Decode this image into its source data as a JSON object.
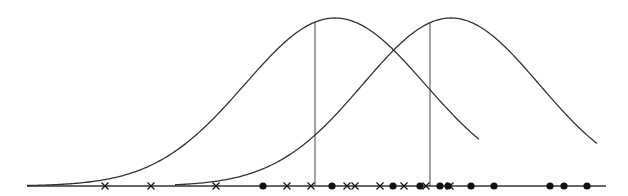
{
  "diagram": {
    "title": "",
    "type": "gaussian-mixture-1d",
    "axis": {
      "x_start": 27,
      "x_end": 606,
      "y": 186,
      "color": "#333333"
    },
    "curves": [
      {
        "name": "gaussian-2",
        "mean_px": 335,
        "sigma_px": 90,
        "peak_y": 18,
        "x_start": 27,
        "x_end": 480
      },
      {
        "name": "gaussian-1",
        "mean_px": 451,
        "sigma_px": 88,
        "peak_y": 18,
        "x_start": 175,
        "x_end": 597
      }
    ],
    "mean_lines": [
      {
        "name": "mu2-line",
        "x": 315,
        "label": "μ",
        "sub": "2"
      },
      {
        "name": "mu1-line",
        "x": 430,
        "label": "μ",
        "sub": "1"
      }
    ],
    "crosses": [
      105,
      151,
      216,
      287,
      311,
      347,
      355,
      380,
      404,
      426,
      450
    ],
    "dots": [
      263,
      332,
      393,
      420,
      440,
      448,
      471,
      494,
      550,
      564,
      587
    ],
    "colors": {
      "line": "#333333",
      "marker": "#111111"
    }
  }
}
